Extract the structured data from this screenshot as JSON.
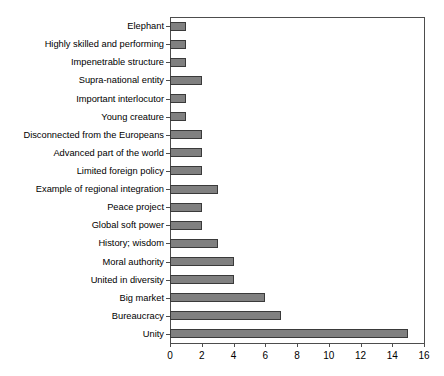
{
  "chart_data": {
    "type": "bar",
    "orientation": "horizontal",
    "title": "",
    "subtitle": "",
    "xlabel": "",
    "ylabel": "",
    "xlim": [
      0,
      16
    ],
    "ylim": null,
    "grid": false,
    "legend": null,
    "legend_position": "none",
    "xticks": [
      0,
      2,
      4,
      6,
      8,
      10,
      12,
      14,
      16
    ],
    "categories": [
      "Elephant",
      "Highly skilled and performing",
      "Impenetrable structure",
      "Supra-national entity",
      "Important interlocutor",
      "Young creature",
      "Disconnected from the Europeans",
      "Advanced part of the world",
      "Limited foreign policy",
      "Example of regional integration",
      "Peace project",
      "Global soft power",
      "History; wisdom",
      "Moral authority",
      "United in diversity",
      "Big market",
      "Bureaucracy",
      "Unity"
    ],
    "values": [
      1,
      1,
      1,
      2,
      1,
      1,
      2,
      2,
      2,
      3,
      2,
      2,
      3,
      4,
      4,
      6,
      7,
      15
    ],
    "bar_color": "#808080",
    "bar_edge_color": "#3a3a3a",
    "axis_color": "#4d4d4d"
  },
  "caption": {
    "text": ""
  }
}
